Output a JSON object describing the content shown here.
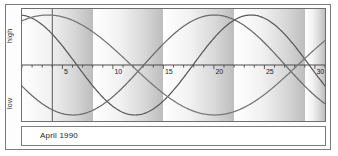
{
  "figure": {
    "caption": "April 1990",
    "y_high_label": "high",
    "y_low_label": "low"
  },
  "chart_data": {
    "type": "line",
    "subtitle": "April 1990",
    "xlabel": "",
    "ylabel": "",
    "xlim": [
      1,
      31
    ],
    "ylim": [
      -1,
      1
    ],
    "grid": false,
    "legend": "none",
    "x_tick_labels": [
      "5",
      "10",
      "15",
      "20",
      "25",
      "30"
    ],
    "x_tick_values": [
      5,
      10,
      15,
      20,
      25,
      30
    ],
    "x_minor_tick_interval": 1,
    "y_axis_labels": {
      "top": "high",
      "zero": "",
      "bottom": "low"
    },
    "zero_line": 0,
    "background_bands": {
      "description": "weekly gradient bands, light-to-dark left-to-right",
      "period_days": 7,
      "starts": [
        1,
        8,
        15,
        22,
        29
      ]
    },
    "series": [
      {
        "name": "physical",
        "cycle_days": 23,
        "color": "#5a5a5a",
        "phase_at_day1_deg": 95,
        "x": [
          1,
          2,
          3,
          4,
          5,
          6,
          7,
          8,
          9,
          10,
          11,
          12,
          13,
          14,
          15,
          16,
          17,
          18,
          19,
          20,
          21,
          22,
          23,
          24,
          25,
          26,
          27,
          28,
          29,
          30,
          31
        ],
        "y": [
          -0.09,
          0.18,
          0.43,
          0.65,
          0.82,
          0.94,
          1.0,
          0.99,
          0.91,
          0.77,
          0.58,
          0.35,
          0.09,
          -0.18,
          -0.43,
          -0.65,
          -0.82,
          -0.94,
          -1.0,
          -0.99,
          -0.91,
          -0.77,
          -0.58,
          -0.35,
          -0.09,
          0.18,
          0.43,
          0.65,
          0.82,
          0.94,
          1.0
        ]
      },
      {
        "name": "emotional",
        "cycle_days": 28,
        "color": "#6a6a6a",
        "phase_at_day1_deg": 205,
        "x": [
          1,
          2,
          3,
          4,
          5,
          6,
          7,
          8,
          9,
          10,
          11,
          12,
          13,
          14,
          15,
          16,
          17,
          18,
          19,
          20,
          21,
          22,
          23,
          24,
          25,
          26,
          27,
          28,
          29,
          30,
          31
        ],
        "y": [
          -0.9,
          -0.78,
          -0.62,
          -0.43,
          -0.22,
          0.0,
          0.22,
          0.43,
          0.62,
          0.78,
          0.9,
          0.97,
          1.0,
          0.97,
          0.9,
          0.78,
          0.62,
          0.43,
          0.22,
          0.0,
          -0.22,
          -0.43,
          -0.62,
          -0.78,
          -0.9,
          -0.97,
          -1.0,
          -0.97,
          -0.9,
          -0.78,
          -0.62
        ]
      },
      {
        "name": "intellectual",
        "cycle_days": 33,
        "color": "#777777",
        "phase_at_day1_deg": 62,
        "x": [
          1,
          2,
          3,
          4,
          5,
          6,
          7,
          8,
          9,
          10,
          11,
          12,
          13,
          14,
          15,
          16,
          17,
          18,
          19,
          20,
          21,
          22,
          23,
          24,
          25,
          26,
          27,
          28,
          29,
          30,
          31
        ],
        "y": [
          0.88,
          0.97,
          1.0,
          0.97,
          0.88,
          0.73,
          0.54,
          0.31,
          0.06,
          -0.19,
          -0.43,
          -0.64,
          -0.81,
          -0.93,
          -0.99,
          -0.99,
          -0.93,
          -0.81,
          -0.64,
          -0.43,
          -0.19,
          0.06,
          0.31,
          0.54,
          0.73,
          0.88,
          0.97,
          1.0,
          0.97,
          0.88,
          0.73
        ]
      }
    ]
  },
  "colors": {
    "frame": "#7d7d7d",
    "axis": "#3a3a3a",
    "band_light": "#ffffff",
    "band_dark": "#bdbdbd",
    "text": "#1d1d1d"
  }
}
